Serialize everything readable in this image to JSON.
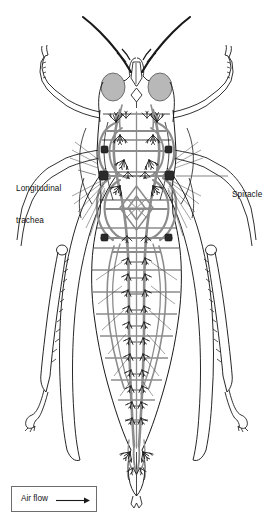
{
  "figure": {
    "view": "dorsal cutaway of a grasshopper showing the internal tracheal (respiratory) system",
    "background_color": "#ffffff",
    "ink_color": "#1a1a1a",
    "trachea_color": "#8c8c8c",
    "eye_fill_color": "#b8b8b8",
    "label_color": "#111111",
    "leader_color": "#6d6d6d"
  },
  "labels": [
    {
      "name": "longitudinal-trachea",
      "line1": "Longitudinal",
      "line2": "trachea",
      "side": "left",
      "leader_from": [
        80,
        172
      ],
      "leader_to": [
        103,
        177
      ]
    },
    {
      "name": "spiracle",
      "line1": "Spiracle",
      "line2": "",
      "side": "right",
      "leader_from": [
        228,
        176
      ],
      "leader_to": [
        176,
        176
      ]
    }
  ],
  "legend": {
    "name": "air-flow-key",
    "text": "Air flow",
    "arrow_direction": "right",
    "box": {
      "x": 11,
      "y": 486,
      "w": 86,
      "h": 26
    }
  },
  "anatomy": {
    "parts": [
      "antenna-left",
      "antenna-right",
      "compound-eye-left",
      "compound-eye-right",
      "head-capsule",
      "thorax",
      "abdomen",
      "abdomen-tip",
      "foreleg-left",
      "foreleg-right",
      "midleg-left",
      "midleg-right",
      "hindleg-left",
      "hindleg-right",
      "longitudinal-tracheal-trunk-left",
      "longitudinal-tracheal-trunk-right",
      "transverse-commissures",
      "air-sacs",
      "spiracles",
      "tracheal-branch-tufts"
    ],
    "spiracle_count_per_side": 10,
    "abdominal_segment_count": 9
  }
}
